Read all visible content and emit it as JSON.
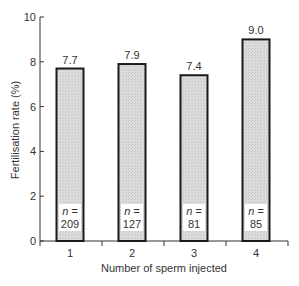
{
  "chart_data": {
    "type": "bar",
    "title": "",
    "xlabel": "Number of sperm injected",
    "ylabel": "Fertilisation rate (%)",
    "categories": [
      "1",
      "2",
      "3",
      "4"
    ],
    "values": [
      7.7,
      7.9,
      7.4,
      9.0
    ],
    "value_labels": [
      "7.7",
      "7.9",
      "7.4",
      "9.0"
    ],
    "n_prefix": "n =",
    "n_values": [
      "209",
      "127",
      "81",
      "85"
    ],
    "ylim": [
      0,
      10
    ],
    "yticks": [
      0,
      2,
      4,
      6,
      8,
      10
    ],
    "grid": false,
    "legend": null,
    "colors": {
      "bar_fill": "#d9d9d9",
      "bar_stroke": "#1a1a1a",
      "axis": "#333333"
    }
  }
}
